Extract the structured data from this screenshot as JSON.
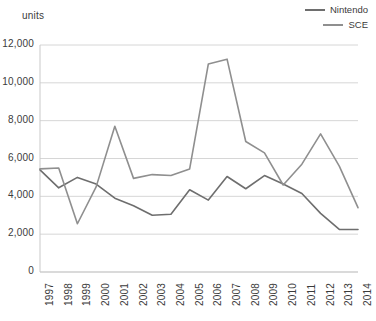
{
  "chart_data": {
    "type": "line",
    "title": "",
    "xlabel": "",
    "ylabel": "units",
    "unit_label": "units",
    "categories": [
      "1997",
      "1998",
      "1999",
      "2000",
      "2001",
      "2002",
      "2003",
      "2004",
      "2005",
      "2006",
      "2007",
      "2008",
      "2009",
      "2010",
      "2011",
      "2012",
      "2013",
      "2014"
    ],
    "x": [
      1997,
      1998,
      1999,
      2000,
      2001,
      2002,
      2003,
      2004,
      2005,
      2006,
      2007,
      2008,
      2009,
      2010,
      2011,
      2012,
      2013,
      2014
    ],
    "ylim": [
      0,
      12000
    ],
    "ytick_values": [
      0,
      2000,
      4000,
      6000,
      8000,
      10000,
      12000
    ],
    "ytick_labels": [
      "0",
      "2,000",
      "4,000",
      "6,000",
      "8,000",
      "10,000",
      "12,000"
    ],
    "grid": true,
    "grid_axis": "y",
    "legend_position": "top-right",
    "series": [
      {
        "name": "Nintendo",
        "color": "#6e6e6e",
        "values": [
          5400,
          4450,
          5000,
          4650,
          3900,
          3500,
          3000,
          3050,
          4350,
          3800,
          5050,
          4400,
          5100,
          4650,
          4150,
          3100,
          2250,
          2250
        ]
      },
      {
        "name": "SCE",
        "color": "#8f8f8f",
        "values": [
          5450,
          5500,
          2550,
          4500,
          7700,
          4950,
          5150,
          5100,
          5450,
          11000,
          11250,
          6900,
          6300,
          4600,
          5700,
          7300,
          5600,
          3400
        ]
      }
    ]
  },
  "legend": {
    "items": [
      {
        "label": "Nintendo",
        "color": "#6e6e6e"
      },
      {
        "label": "SCE",
        "color": "#8f8f8f"
      }
    ]
  },
  "axes": {
    "unit_caption": "units"
  }
}
